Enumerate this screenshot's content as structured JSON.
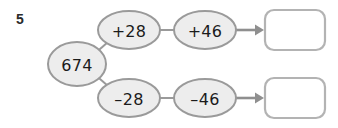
{
  "page": {
    "question_number": "5",
    "background_color": "#ffffff"
  },
  "palette": {
    "oval_fill": "#ededed",
    "oval_stroke": "#9a9a9a",
    "text_color": "#1b1b1b",
    "box_stroke": "#b3b3b3",
    "arrow_color": "#8f8f8f"
  },
  "diagram": {
    "start": {
      "label": "674",
      "shape": "oval"
    },
    "branches": [
      {
        "name": "top-branch",
        "steps": [
          {
            "label": "+28",
            "shape": "oval"
          },
          {
            "label": "+46",
            "shape": "oval"
          }
        ],
        "answer": {
          "value": "",
          "placeholder": ""
        }
      },
      {
        "name": "bottom-branch",
        "steps": [
          {
            "label": "–28",
            "shape": "oval"
          },
          {
            "label": "–46",
            "shape": "oval"
          }
        ],
        "answer": {
          "value": "",
          "placeholder": ""
        }
      }
    ]
  }
}
